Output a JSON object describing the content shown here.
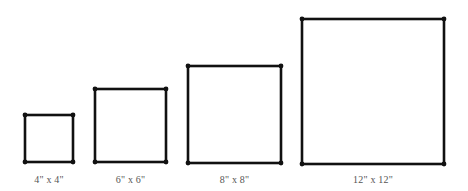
{
  "diagram": {
    "stroke_color": "#111111",
    "label_color": "#555555",
    "squares": [
      {
        "label": "4\" x 4\"",
        "size_in": 4,
        "x1": 25,
        "y1": 115,
        "x2": 73,
        "y2": 162
      },
      {
        "label": "6\" x 6\"",
        "size_in": 6,
        "x1": 95,
        "y1": 89,
        "x2": 166,
        "y2": 162
      },
      {
        "label": "8\" x 8\"",
        "size_in": 8,
        "x1": 188,
        "y1": 66,
        "x2": 281,
        "y2": 163
      },
      {
        "label": "12\" x 12\"",
        "size_in": 12,
        "x1": 302,
        "y1": 19,
        "x2": 444,
        "y2": 164
      }
    ]
  }
}
